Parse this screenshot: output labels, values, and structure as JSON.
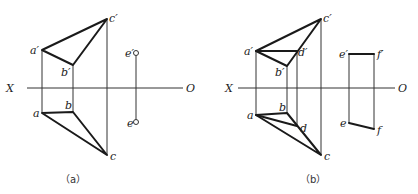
{
  "figures": [
    {
      "id": "a",
      "caption": "（a）",
      "axis": {
        "left_label": "X",
        "right_label": "O"
      },
      "points": {
        "a_prime": "a′",
        "b_prime": "b′",
        "c_prime": "c′",
        "e_prime": "e′",
        "a": "a",
        "b": "b",
        "c": "c",
        "e": "e"
      }
    },
    {
      "id": "b",
      "caption": "（b）",
      "axis": {
        "left_label": "X",
        "right_label": "O"
      },
      "points": {
        "a_prime": "a′",
        "b_prime": "b′",
        "c_prime": "c′",
        "d_prime": "d′",
        "e_prime": "e′",
        "f_prime": "f′",
        "a": "a",
        "b": "b",
        "c": "c",
        "d": "d",
        "e": "e",
        "f": "f"
      }
    }
  ]
}
